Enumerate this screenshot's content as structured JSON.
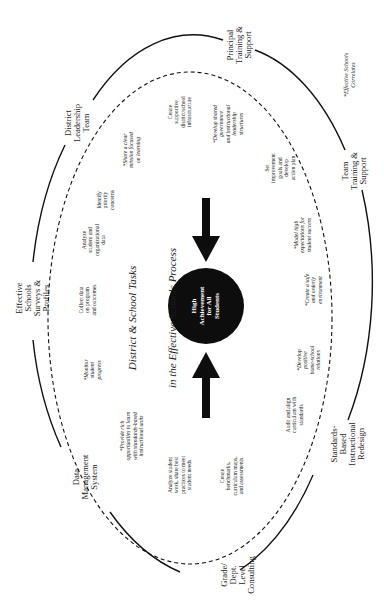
{
  "diagram": {
    "title_line1": "District & School Tasks",
    "title_line2": "in the Effective Schools Process",
    "center": "High\nAchievement\nfor All\nStudents",
    "footnote": "*Effective Schools\nCorrelates",
    "outer_ring": [
      {
        "id": "principal",
        "label": "Principal\nTraining &\nSupport"
      },
      {
        "id": "district",
        "label": "District\nLeadership\nTeam"
      },
      {
        "id": "surveys",
        "label": "Effective\nSchools\nSurveys &\nProfiles"
      },
      {
        "id": "data",
        "label": "Data\nManagement\nSystem"
      },
      {
        "id": "grade",
        "label": "Grade/\nDept.\nLevel\nConsulting"
      },
      {
        "id": "standards",
        "label": "Standards-\nBased\nInstructional\nRedesign"
      },
      {
        "id": "team",
        "label": "Team\nTraining &\nSupport"
      }
    ],
    "tasks": [
      {
        "id": "create-infrastructure",
        "label": "Create\nsupportive\ndistrict/school\ninfrastructure"
      },
      {
        "id": "identify-concerns",
        "label": "Identify\npriority\nconcerns"
      },
      {
        "id": "analyze-data",
        "label": "Analyze\nstudent and\norganizational\ndata"
      },
      {
        "id": "collect-data",
        "label": "Collect data\non program\nand outcomes"
      },
      {
        "id": "analyze-work",
        "label": "Analyze student\nwork, share best\npractices to meet\nstudent needs"
      },
      {
        "id": "create-benchmarks",
        "label": "Create\nbenchmarks,\ncurriculum maps,\nand assessments"
      },
      {
        "id": "audit-curriculum",
        "label": "Audit and align\ncurriculum with\nstandards"
      },
      {
        "id": "set-goals",
        "label": "Set\nimprovement\ngoals and\ndevelop\naction plan"
      }
    ],
    "correlates": [
      {
        "id": "clear-mission",
        "label": "*Share a clear\nmission focused\non learning"
      },
      {
        "id": "shared-governance",
        "label": "*Develop shared\ngovernance\nand instructional\nleadership\nstructures"
      },
      {
        "id": "monitor-progress",
        "label": "*Monitor\nstudent\nprogress"
      },
      {
        "id": "provide-opportunities",
        "label": "*Provide rich\nopportunities to learn\nwith standards-based\ninstructional units"
      },
      {
        "id": "home-school",
        "label": "*Develop\npositive\nhome-school\nrelations"
      },
      {
        "id": "safe-environment",
        "label": "*Create a safe\nand orderly\nenvironment"
      },
      {
        "id": "high-expectations",
        "label": "*Model high\nexpectations for\nstudent success"
      }
    ],
    "colors": {
      "ink": "#111111",
      "background": "#ffffff",
      "center_fill": "#0d0d0d"
    }
  }
}
